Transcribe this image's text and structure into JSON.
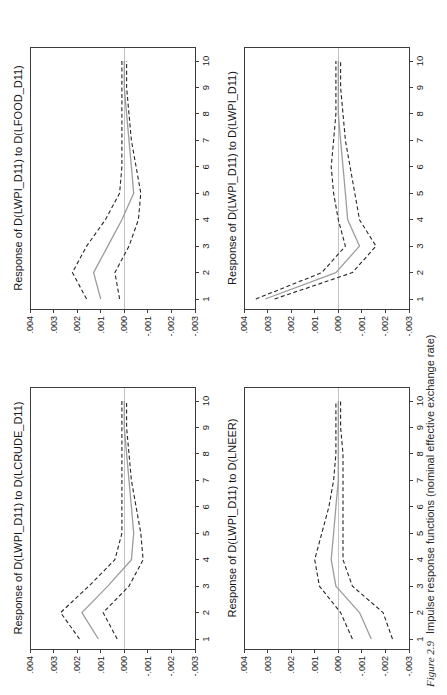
{
  "figure": {
    "caption_label": "Figure 2.9",
    "caption_text": "Impulse response functions (nominal effective exchange rate)",
    "orientation": "rotated 90 degrees counterclockwise on portrait page"
  },
  "colors": {
    "dashed_band_line": "#262626",
    "response_line": "#9c9c9c",
    "zero_gridline": "#c3c3c3",
    "plot_frame": "#3c3c3c",
    "text": "#1c1c1c",
    "background": "#ffffff"
  },
  "chart_data": [
    {
      "type": "line",
      "position": "top-left",
      "title": "Response of D(LWPI_D11) to D(LCRUDE_D11)",
      "x": [
        1,
        2,
        3,
        4,
        5,
        6,
        7,
        8,
        9,
        10
      ],
      "xlim": [
        1,
        10
      ],
      "ylim": [
        -0.003,
        0.004
      ],
      "yticks": [
        ".004",
        ".003",
        ".002",
        ".001",
        ".000",
        "-.001",
        "-.002",
        "-.003"
      ],
      "grid": "horizontal zero line only",
      "legend": "none",
      "series": [
        {
          "name": "upper-2se-band",
          "style": "dashed-black",
          "values": [
            0.0019,
            0.0027,
            0.0015,
            0.0004,
            0.0001,
            0.0001,
            0.0001,
            0.0001,
            0.0001,
            0.0001
          ]
        },
        {
          "name": "lower-2se-band",
          "style": "dashed-black",
          "values": [
            0.0003,
            0.0009,
            -0.0002,
            -0.0008,
            -0.0007,
            -0.0005,
            -0.0003,
            -0.0002,
            -0.0001,
            -0.0001
          ]
        },
        {
          "name": "response",
          "style": "solid-gray",
          "values": [
            0.0011,
            0.0018,
            0.0007,
            -0.0003,
            -0.0004,
            -0.0003,
            -0.0002,
            -0.0001,
            0.0,
            0.0
          ]
        }
      ]
    },
    {
      "type": "line",
      "position": "top-right",
      "title": "Response of D(LWPI_D11) to D(LFOOD_D11)",
      "x": [
        1,
        2,
        3,
        4,
        5,
        6,
        7,
        8,
        9,
        10
      ],
      "xlim": [
        1,
        10
      ],
      "ylim": [
        -0.003,
        0.004
      ],
      "yticks": [
        ".004",
        ".003",
        ".002",
        ".001",
        ".000",
        "-.001",
        "-.002",
        "-.003"
      ],
      "grid": "horizontal zero line only",
      "legend": "none",
      "series": [
        {
          "name": "upper-2se-band",
          "style": "dashed-black",
          "values": [
            0.0016,
            0.0022,
            0.0016,
            0.0008,
            0.0002,
            0.0001,
            0.0001,
            0.0001,
            0.0001,
            0.0001
          ]
        },
        {
          "name": "lower-2se-band",
          "style": "dashed-black",
          "values": [
            0.0002,
            0.0004,
            -0.0002,
            -0.0006,
            -0.0007,
            -0.0005,
            -0.0003,
            -0.0002,
            -0.0001,
            -0.0001
          ]
        },
        {
          "name": "response",
          "style": "solid-gray",
          "values": [
            0.001,
            0.0013,
            0.0007,
            0.0001,
            -0.0004,
            -0.0003,
            -0.0002,
            -0.0001,
            0.0,
            0.0
          ]
        }
      ]
    },
    {
      "type": "line",
      "position": "bottom-left",
      "title": "Response of D(LWPI_D11) to D(LNEER)",
      "x": [
        1,
        2,
        3,
        4,
        5,
        6,
        7,
        8,
        9,
        10
      ],
      "xlim": [
        1,
        10
      ],
      "ylim": [
        -0.003,
        0.004
      ],
      "yticks": [
        ".004",
        ".003",
        ".002",
        ".001",
        ".000",
        "-.001",
        "-.002",
        "-.003"
      ],
      "grid": "horizontal zero line only",
      "legend": "none",
      "series": [
        {
          "name": "upper-2se-band",
          "style": "dashed-black",
          "values": [
            -0.0006,
            -0.0001,
            0.0008,
            0.001,
            0.0007,
            0.0004,
            0.0002,
            0.0001,
            0.0001,
            0.0001
          ]
        },
        {
          "name": "lower-2se-band",
          "style": "dashed-black",
          "values": [
            -0.0023,
            -0.0019,
            -0.0006,
            -0.0002,
            -0.0002,
            -0.0002,
            -0.0002,
            -0.0002,
            -0.0001,
            -0.0001
          ]
        },
        {
          "name": "response",
          "style": "solid-gray",
          "values": [
            -0.0014,
            -0.0009,
            0.0001,
            0.0003,
            0.0002,
            0.0001,
            0.0,
            0.0,
            0.0,
            0.0
          ]
        }
      ]
    },
    {
      "type": "line",
      "position": "bottom-right",
      "title": "Response of D(LWPI_D11) to D(LWPI_D11)",
      "x": [
        1,
        2,
        3,
        4,
        5,
        6,
        7,
        8,
        9,
        10
      ],
      "xlim": [
        1,
        10
      ],
      "ylim": [
        -0.003,
        0.004
      ],
      "yticks": [
        ".004",
        ".003",
        ".002",
        ".001",
        ".000",
        "-.001",
        "-.002",
        "-.003"
      ],
      "grid": "horizontal zero line only",
      "legend": "none",
      "series": [
        {
          "name": "upper-2se-band",
          "style": "dashed-black",
          "values": [
            0.0035,
            0.0007,
            -0.0003,
            0.0,
            0.0002,
            0.0003,
            0.0002,
            0.0001,
            0.0001,
            0.0001
          ]
        },
        {
          "name": "lower-2se-band",
          "style": "dashed-black",
          "values": [
            0.0027,
            -0.0006,
            -0.0016,
            -0.0009,
            -0.0007,
            -0.0005,
            -0.0003,
            -0.0002,
            -0.0001,
            -0.0001
          ]
        },
        {
          "name": "response",
          "style": "solid-gray",
          "values": [
            0.0031,
            0.0001,
            -0.0009,
            -0.0004,
            -0.0003,
            -0.0002,
            -0.0001,
            0.0,
            0.0,
            0.0
          ]
        }
      ]
    }
  ]
}
